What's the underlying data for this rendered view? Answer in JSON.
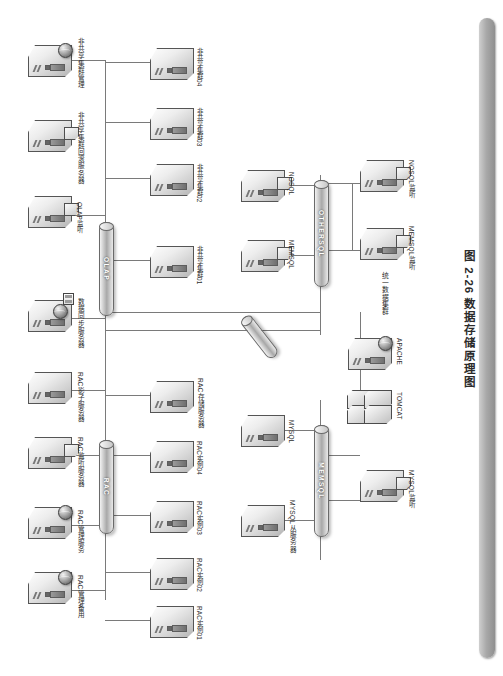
{
  "figure": {
    "caption_number": "图 2-26",
    "caption_title": "数据存储原理图",
    "caption_full": "图 2-26  数据存储原理图"
  },
  "buses": [
    {
      "id": "olap",
      "label": "OLAP"
    },
    {
      "id": "rac",
      "label": "RAC"
    },
    {
      "id": "othersql",
      "label": "OTHERSQL"
    },
    {
      "id": "memsql",
      "label": "MEMSQL"
    },
    {
      "id": "tilted",
      "label": ""
    }
  ],
  "groups": {
    "unified_cluster": "统一数据集群"
  },
  "nodes": [
    {
      "id": "n01",
      "label": "非共享集群管理",
      "icon": "server-globe"
    },
    {
      "id": "n02",
      "label": "非共享集群回滚服务器",
      "icon": "server-tab"
    },
    {
      "id": "n03",
      "label": "OLAP监听",
      "icon": "server-tab"
    },
    {
      "id": "n04",
      "label": "数据同步服务器",
      "icon": "server-globe-chip"
    },
    {
      "id": "n05",
      "label": "RAC影子服务器",
      "icon": "server"
    },
    {
      "id": "n06",
      "label": "RAC监听服务器",
      "icon": "server-tab"
    },
    {
      "id": "n07",
      "label": "RAC管理服务",
      "icon": "server-globe"
    },
    {
      "id": "n08",
      "label": "RAC管理备用",
      "icon": "server-globe"
    },
    {
      "id": "n09",
      "label": "非共享集群04",
      "icon": "server"
    },
    {
      "id": "n10",
      "label": "非共享集群03",
      "icon": "server"
    },
    {
      "id": "n11",
      "label": "非共享集群02",
      "icon": "server"
    },
    {
      "id": "n12",
      "label": "非共享集群01",
      "icon": "server"
    },
    {
      "id": "n13",
      "label": "RAC存储服务器",
      "icon": "server"
    },
    {
      "id": "n14",
      "label": "RAC实例04",
      "icon": "server"
    },
    {
      "id": "n15",
      "label": "RAC实例03",
      "icon": "server"
    },
    {
      "id": "n16",
      "label": "RAC实例02",
      "icon": "server"
    },
    {
      "id": "n17",
      "label": "RAC实例01",
      "icon": "server"
    },
    {
      "id": "n18",
      "label": "NOSQL",
      "icon": "server-tab"
    },
    {
      "id": "n19",
      "label": "MEMSQL",
      "icon": "server-tab"
    },
    {
      "id": "n20",
      "label": "MYSQL",
      "icon": "server"
    },
    {
      "id": "n21",
      "label": "MYSQL从服务器",
      "icon": "server"
    },
    {
      "id": "n22",
      "label": "NOSQL监听",
      "icon": "server-tab"
    },
    {
      "id": "n23",
      "label": "MEMSQL监听",
      "icon": "server-tab"
    },
    {
      "id": "n24",
      "label": "MYSQL监听",
      "icon": "server-tab"
    },
    {
      "id": "n25",
      "label": "APACHE",
      "icon": "server-globe"
    },
    {
      "id": "n26",
      "label": "TOMCAT",
      "icon": "server-rack"
    }
  ],
  "colors": {
    "line": "#7a7a7a",
    "bar": "#a9a9a9",
    "text": "#2c2c2c",
    "bus_text": "#ffffff"
  }
}
